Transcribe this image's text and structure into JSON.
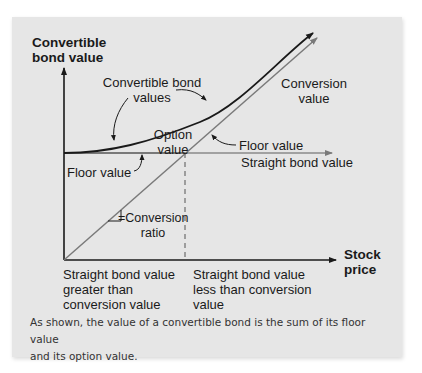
{
  "figure": {
    "y_axis_label_line1": "Convertible",
    "y_axis_label_line2": "bond value",
    "x_axis_label_line1": "Stock",
    "x_axis_label_line2": "price",
    "annotations": {
      "convertible_bond_values_line1": "Convertible bond",
      "convertible_bond_values_line2": "values",
      "conversion_value_line1": "Conversion",
      "conversion_value_line2": "value",
      "option_value_line1": "Option",
      "option_value_line2": "value",
      "floor_value_left": "Floor value",
      "floor_value_right": "Floor value",
      "straight_bond_value": "Straight bond value",
      "conversion_ratio_line1": "=Conversion",
      "conversion_ratio_line2": "ratio"
    },
    "regions": {
      "left_line1": "Straight bond value",
      "left_line2": "greater than",
      "left_line3": "conversion value",
      "right_line1": "Straight bond value",
      "right_line2": "less than conversion",
      "right_line3": "value"
    },
    "caption_line1": "As shown, the value of a convertible bond is the sum of its floor value",
    "caption_line2": "and its option value.",
    "colors": {
      "panel_background": "#e6e6e6",
      "convertible_curve": "#1a1a1a",
      "conversion_line": "#7a7a7a",
      "axes": "#1a1a1a"
    }
  }
}
